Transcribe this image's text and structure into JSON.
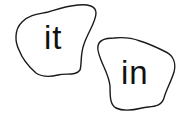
{
  "cards": [
    {
      "word": "it",
      "stroke": "#1a1a1a"
    },
    {
      "word": "in",
      "stroke": "#1a1a1a"
    }
  ],
  "colors": {
    "background": "#ffffff",
    "text": "#111111",
    "outline": "#1a1a1a"
  }
}
